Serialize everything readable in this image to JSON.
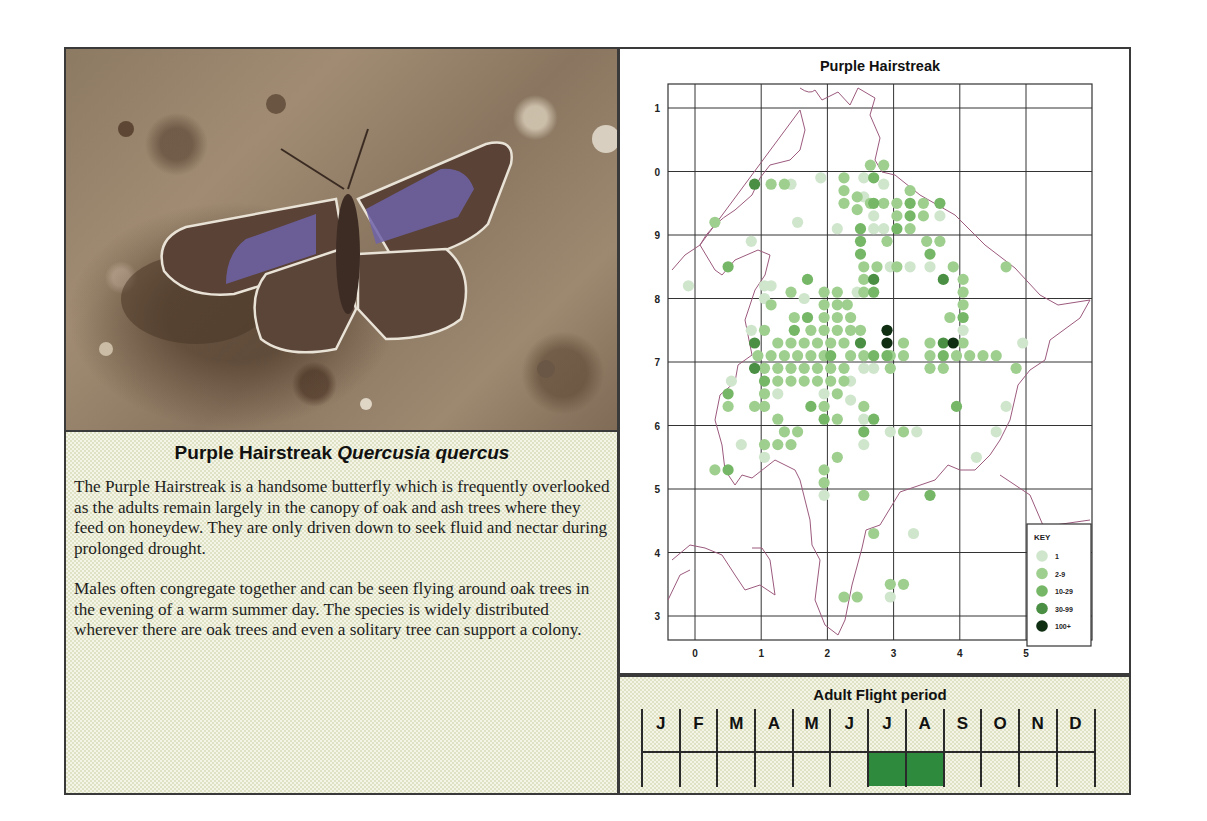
{
  "species": {
    "common_name": "Purple Hairstreak",
    "scientific_name": "Quercusia quercus",
    "description_paragraphs": [
      "The Purple Hairstreak is a handsome butterfly which is frequently overlooked as the adults remain largely in the canopy of oak and ash trees where they feed on honeydew. They are only driven down to seek fluid and nectar during prolonged drought.",
      "Males often congregate together and can be seen flying around oak trees in the evening of a warm summer day.  The species is widely distributed wherever there are oak trees and even a solitary tree can support a colony."
    ]
  },
  "photo": {
    "subject": "Purple Hairstreak butterfly resting on soil with open wings showing purple patches"
  },
  "map": {
    "title": "Purple Hairstreak",
    "x_ticks": [
      "0",
      "1",
      "2",
      "3",
      "4",
      "5"
    ],
    "y_ticks": [
      "1",
      "0",
      "9",
      "8",
      "7",
      "6",
      "5",
      "4",
      "3"
    ],
    "key": {
      "title": "KEY",
      "items": [
        {
          "label": "1",
          "color": "#cfe6cc"
        },
        {
          "label": "2-9",
          "color": "#9fcf8f"
        },
        {
          "label": "10-29",
          "color": "#76b767"
        },
        {
          "label": "30-99",
          "color": "#4a8f43"
        },
        {
          "label": "100+",
          "color": "#0f2e12"
        }
      ]
    }
  },
  "chart_data": {
    "type": "scatter",
    "title": "Purple Hairstreak",
    "xlabel": "",
    "ylabel": "",
    "x_tick_labels": [
      "0",
      "1",
      "2",
      "3",
      "4",
      "5"
    ],
    "y_tick_labels": [
      "1",
      "0",
      "9",
      "8",
      "7",
      "6",
      "5",
      "4",
      "3"
    ],
    "grid": true,
    "legend": {
      "title": "KEY",
      "position": "lower right",
      "entries": [
        "1",
        "2-9",
        "10-29",
        "30-99",
        "100+"
      ]
    },
    "note": "Distribution dot map; each dot is a tetrad record colored by count class. Coordinates are grid units (x 0-5 easting, y index 0=top line '1' ... 8=bottom line '3').",
    "series": [
      {
        "name": "1",
        "points": [
          [
            -0.1,
            8.2
          ],
          [
            0.85,
            8.9
          ],
          [
            1.05,
            8.2
          ],
          [
            1.15,
            8.2
          ],
          [
            1.05,
            8.0
          ],
          [
            1.65,
            8.0
          ],
          [
            0.85,
            7.5
          ],
          [
            0.55,
            6.7
          ],
          [
            1.25,
            6.5
          ],
          [
            1.95,
            6.5
          ],
          [
            2.35,
            6.4
          ],
          [
            2.35,
            6.7
          ],
          [
            2.55,
            6.1
          ],
          [
            2.55,
            5.7
          ],
          [
            1.05,
            5.5
          ],
          [
            0.7,
            5.7
          ],
          [
            1.95,
            4.9
          ],
          [
            1.55,
            9.2
          ],
          [
            2.15,
            9.1
          ],
          [
            1.9,
            9.9
          ],
          [
            2.55,
            9.9
          ],
          [
            2.85,
            9.8
          ],
          [
            2.7,
            9.3
          ],
          [
            2.7,
            9.1
          ],
          [
            2.85,
            9.1
          ],
          [
            3.7,
            9.3
          ],
          [
            2.45,
            8.1
          ],
          [
            2.55,
            6.9
          ],
          [
            2.7,
            6.9
          ],
          [
            2.95,
            5.9
          ],
          [
            3.35,
            5.9
          ],
          [
            4.55,
            5.9
          ],
          [
            4.25,
            5.5
          ],
          [
            4.95,
            7.3
          ],
          [
            4.05,
            7.5
          ],
          [
            4.7,
            6.3
          ],
          [
            3.3,
            4.3
          ],
          [
            2.95,
            3.3
          ],
          [
            1.45,
            9.8
          ],
          [
            3.55,
            8.5
          ],
          [
            3.25,
            8.5
          ],
          [
            2.95,
            8.5
          ],
          [
            2.55,
            9.6
          ]
        ]
      },
      {
        "name": "2-9",
        "points": [
          [
            0.3,
            9.2
          ],
          [
            1.15,
            9.8
          ],
          [
            1.35,
            9.8
          ],
          [
            2.45,
            9.6
          ],
          [
            2.45,
            9.4
          ],
          [
            2.65,
            10.1
          ],
          [
            2.85,
            10.1
          ],
          [
            2.25,
            9.9
          ],
          [
            2.25,
            9.7
          ],
          [
            2.25,
            9.5
          ],
          [
            2.65,
            9.5
          ],
          [
            2.85,
            9.5
          ],
          [
            3.05,
            9.5
          ],
          [
            3.25,
            9.7
          ],
          [
            3.45,
            9.5
          ],
          [
            3.05,
            9.3
          ],
          [
            3.25,
            9.1
          ],
          [
            3.45,
            9.3
          ],
          [
            2.9,
            8.9
          ],
          [
            3.5,
            8.9
          ],
          [
            3.7,
            8.9
          ],
          [
            2.55,
            8.5
          ],
          [
            2.75,
            8.5
          ],
          [
            3.05,
            8.5
          ],
          [
            3.9,
            8.5
          ],
          [
            4.7,
            8.5
          ],
          [
            2.55,
            8.3
          ],
          [
            2.55,
            8.1
          ],
          [
            1.45,
            8.1
          ],
          [
            1.95,
            8.1
          ],
          [
            2.15,
            8.1
          ],
          [
            1.15,
            7.9
          ],
          [
            1.95,
            7.9
          ],
          [
            2.15,
            7.9
          ],
          [
            2.3,
            7.9
          ],
          [
            1.5,
            7.7
          ],
          [
            1.75,
            7.5
          ],
          [
            1.95,
            7.7
          ],
          [
            2.15,
            7.7
          ],
          [
            2.35,
            7.7
          ],
          [
            1.05,
            7.5
          ],
          [
            1.25,
            7.3
          ],
          [
            1.45,
            7.3
          ],
          [
            1.65,
            7.3
          ],
          [
            1.85,
            7.3
          ],
          [
            2.05,
            7.3
          ],
          [
            2.25,
            7.3
          ],
          [
            2.5,
            7.5
          ],
          [
            1.95,
            7.5
          ],
          [
            2.15,
            7.5
          ],
          [
            2.35,
            7.5
          ],
          [
            0.95,
            7.1
          ],
          [
            1.15,
            7.1
          ],
          [
            1.35,
            7.1
          ],
          [
            1.55,
            7.1
          ],
          [
            1.75,
            7.1
          ],
          [
            1.95,
            7.1
          ],
          [
            2.35,
            7.1
          ],
          [
            2.55,
            7.1
          ],
          [
            3.15,
            7.1
          ],
          [
            1.05,
            6.9
          ],
          [
            1.25,
            6.9
          ],
          [
            1.45,
            6.9
          ],
          [
            1.65,
            6.9
          ],
          [
            1.85,
            6.9
          ],
          [
            2.05,
            6.9
          ],
          [
            2.25,
            6.9
          ],
          [
            2.95,
            6.9
          ],
          [
            3.55,
            6.9
          ],
          [
            3.75,
            6.9
          ],
          [
            1.25,
            6.7
          ],
          [
            1.45,
            6.7
          ],
          [
            1.65,
            6.7
          ],
          [
            1.85,
            6.7
          ],
          [
            2.05,
            6.7
          ],
          [
            2.25,
            6.7
          ],
          [
            1.05,
            6.5
          ],
          [
            2.15,
            6.5
          ],
          [
            0.5,
            6.3
          ],
          [
            0.9,
            6.3
          ],
          [
            1.05,
            6.3
          ],
          [
            1.95,
            6.3
          ],
          [
            2.55,
            6.3
          ],
          [
            1.25,
            6.1
          ],
          [
            2.15,
            6.1
          ],
          [
            1.35,
            5.9
          ],
          [
            1.55,
            5.9
          ],
          [
            1.05,
            5.7
          ],
          [
            1.25,
            5.7
          ],
          [
            1.45,
            5.7
          ],
          [
            0.3,
            5.3
          ],
          [
            1.95,
            5.3
          ],
          [
            1.95,
            5.1
          ],
          [
            2.55,
            4.9
          ],
          [
            2.15,
            5.5
          ],
          [
            2.7,
            4.3
          ],
          [
            2.95,
            3.5
          ],
          [
            3.15,
            3.5
          ],
          [
            2.25,
            3.3
          ],
          [
            2.45,
            3.3
          ],
          [
            3.15,
            7.3
          ],
          [
            3.55,
            7.3
          ],
          [
            3.55,
            7.1
          ],
          [
            3.95,
            7.1
          ],
          [
            4.15,
            7.1
          ],
          [
            4.35,
            7.1
          ],
          [
            4.55,
            7.1
          ],
          [
            4.05,
            7.3
          ],
          [
            3.85,
            7.7
          ],
          [
            4.05,
            7.9
          ],
          [
            4.05,
            8.1
          ],
          [
            4.05,
            8.3
          ],
          [
            4.85,
            6.9
          ],
          [
            3.15,
            5.9
          ],
          [
            2.95,
            7.1
          ]
        ]
      },
      {
        "name": "10-29",
        "points": [
          [
            0.5,
            8.5
          ],
          [
            1.7,
            8.3
          ],
          [
            2.5,
            9.1
          ],
          [
            2.5,
            8.9
          ],
          [
            2.5,
            8.7
          ],
          [
            2.7,
            9.9
          ],
          [
            2.7,
            9.5
          ],
          [
            3.25,
            9.5
          ],
          [
            3.25,
            9.3
          ],
          [
            3.05,
            9.1
          ],
          [
            3.55,
            8.7
          ],
          [
            3.7,
            9.5
          ],
          [
            4.05,
            7.7
          ],
          [
            2.7,
            8.1
          ],
          [
            1.5,
            7.5
          ],
          [
            1.7,
            7.7
          ],
          [
            1.05,
            6.7
          ],
          [
            2.05,
            7.1
          ],
          [
            2.7,
            7.1
          ],
          [
            2.9,
            7.1
          ],
          [
            3.75,
            7.1
          ],
          [
            2.55,
            5.9
          ],
          [
            0.5,
            5.3
          ],
          [
            3.55,
            4.9
          ],
          [
            3.95,
            6.3
          ],
          [
            1.75,
            6.3
          ],
          [
            1.95,
            6.1
          ],
          [
            0.5,
            6.5
          ],
          [
            2.7,
            6.1
          ]
        ]
      },
      {
        "name": "30-99",
        "points": [
          [
            0.9,
            9.8
          ],
          [
            0.9,
            7.3
          ],
          [
            0.9,
            6.9
          ],
          [
            2.5,
            7.3
          ],
          [
            3.75,
            7.3
          ],
          [
            2.7,
            8.3
          ],
          [
            3.75,
            8.3
          ]
        ]
      },
      {
        "name": "100+",
        "points": [
          [
            2.9,
            7.5
          ],
          [
            2.9,
            7.3
          ],
          [
            3.9,
            7.3
          ]
        ]
      }
    ]
  },
  "flight_period": {
    "title": "Adult Flight period",
    "months": [
      {
        "label": "J",
        "active": false
      },
      {
        "label": "F",
        "active": false
      },
      {
        "label": "M",
        "active": false
      },
      {
        "label": "A",
        "active": false
      },
      {
        "label": "M",
        "active": false
      },
      {
        "label": "J",
        "active": false
      },
      {
        "label": "J",
        "active": true
      },
      {
        "label": "A",
        "active": true
      },
      {
        "label": "S",
        "active": false
      },
      {
        "label": "O",
        "active": false
      },
      {
        "label": "N",
        "active": false
      },
      {
        "label": "D",
        "active": false
      }
    ],
    "active_color": "#2e8b3e"
  }
}
